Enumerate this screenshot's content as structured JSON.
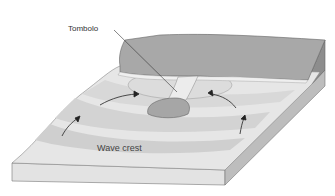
{
  "diagram": {
    "labels": {
      "tombolo": "Tombolo",
      "wave_crest": "Wave crest"
    },
    "colors": {
      "land_top": "#a9a9a9",
      "land_side": "#8f8f8f",
      "sand": "#e6e6e6",
      "sea_light": "#ececec",
      "sea_mid": "#d4d4d4",
      "sea_dark": "#bdbdbd",
      "base_front": "#e0e0e0",
      "base_side": "#b8b8b8",
      "outline": "#555555"
    }
  }
}
